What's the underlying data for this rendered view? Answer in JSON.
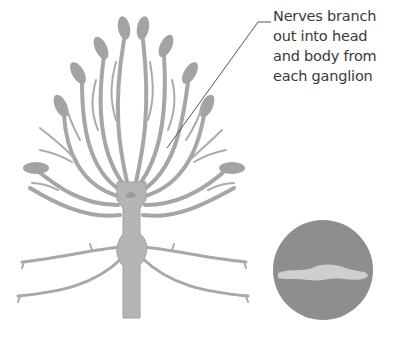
{
  "diagram": {
    "annotation": {
      "lines": [
        "Nerves branch",
        "out into head",
        "and body from",
        "each ganglion"
      ]
    },
    "colors": {
      "nerve": "#a6a6a6",
      "ganglion": "#b5b5b5",
      "inset_circle": "#8e8e8e",
      "inset_worm": "#cfcfcf",
      "label_text": "#3a3a3a",
      "leader_line": "#555555"
    },
    "inset": {
      "description": "circular inset showing whole worm silhouette"
    }
  }
}
